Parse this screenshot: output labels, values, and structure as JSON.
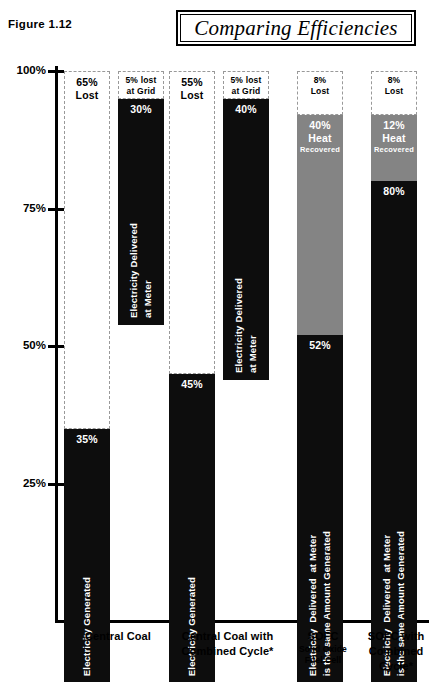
{
  "figure_label": "Figure 1.12",
  "title": "Comparing Efficiencies",
  "chart_data": {
    "type": "bar",
    "title": "Comparing Efficiencies",
    "xlabel": "",
    "ylabel": "",
    "ylim": [
      0,
      100
    ],
    "ytick_labels": [
      "100%",
      "75%",
      "50%",
      "25%"
    ],
    "ytick_values": [
      100,
      75,
      50,
      25
    ],
    "grid": false,
    "legend": false,
    "units": "percent",
    "groups": [
      {
        "category": "Central Coal",
        "category_sub": "",
        "bars": [
          {
            "name": "Electricity Generated",
            "rotated_label": "Electricity Generated",
            "segments": [
              {
                "kind": "lost",
                "value": 65,
                "label": "65%",
                "label2": "Lost",
                "label3": ""
              },
              {
                "kind": "black",
                "value": 35,
                "label": "35%",
                "label2": "",
                "label3": ""
              }
            ]
          },
          {
            "name": "Electricity Delivered at Meter",
            "rotated_label": "Electricity Delivered\nat Meter",
            "segments": [
              {
                "kind": "lost",
                "value": 5,
                "label": "5% lost",
                "label2": "at Grid",
                "label3": ""
              },
              {
                "kind": "black",
                "value": 30,
                "label": "30%",
                "label2": "",
                "label3": ""
              }
            ]
          }
        ]
      },
      {
        "category": "Central Coal with Combined Cycle*",
        "category_sub": "",
        "bars": [
          {
            "name": "Electricity Generated",
            "rotated_label": "Electricity Generated",
            "segments": [
              {
                "kind": "lost",
                "value": 55,
                "label": "55%",
                "label2": "Lost",
                "label3": ""
              },
              {
                "kind": "black",
                "value": 45,
                "label": "45%",
                "label2": "",
                "label3": ""
              }
            ]
          },
          {
            "name": "Electricity Delivered at Meter",
            "rotated_label": "Electricity Delivered\nat Meter",
            "segments": [
              {
                "kind": "lost",
                "value": 5,
                "label": "5% lost",
                "label2": "at Grid",
                "label3": ""
              },
              {
                "kind": "black",
                "value": 40,
                "label": "40%",
                "label2": "",
                "label3": ""
              }
            ]
          }
        ]
      },
      {
        "category": "SOFC",
        "category_sub": "Solid Oxide\nFuel Cell",
        "bars": [
          {
            "name": "SOFC output",
            "rotated_label": "Electricity  Delivered  at Meter\nis the same Amount Generated",
            "segments": [
              {
                "kind": "lost",
                "value": 8,
                "label": "8%",
                "label2": "Lost",
                "label3": ""
              },
              {
                "kind": "gray",
                "value": 40,
                "label": "40%",
                "label2": "Heat",
                "label3": "Recovered"
              },
              {
                "kind": "black",
                "value": 52,
                "label": "52%",
                "label2": "",
                "label3": ""
              }
            ]
          }
        ]
      },
      {
        "category": "SOFC with Combined Cycle*",
        "category_sub": "",
        "bars": [
          {
            "name": "SOFC with Combined Cycle output",
            "rotated_label": "Electricity  Delivered  at Meter\nis the same Amount Generated",
            "segments": [
              {
                "kind": "lost",
                "value": 8,
                "label": "8%",
                "label2": "Lost",
                "label3": ""
              },
              {
                "kind": "gray",
                "value": 12,
                "label": "12%",
                "label2": "Heat",
                "label3": "Recovered"
              },
              {
                "kind": "black",
                "value": 80,
                "label": "80%",
                "label2": "",
                "label3": ""
              }
            ]
          }
        ]
      }
    ],
    "colors": {
      "generated_black": "#0d0d0d",
      "heat_recovered_gray": "#848484",
      "lost_fill": "#ffffff",
      "lost_border": "#999999",
      "axis": "#000000"
    }
  },
  "category_labels": [
    {
      "main": "Central Coal",
      "sub": ""
    },
    {
      "main": "Central Coal with\nCombined Cycle*",
      "sub": ""
    },
    {
      "main": "SOFC",
      "sub": "Solid Oxide\nFuel Cell"
    },
    {
      "main": "SOFC with\nCombined\nCycle*",
      "sub": ""
    }
  ]
}
